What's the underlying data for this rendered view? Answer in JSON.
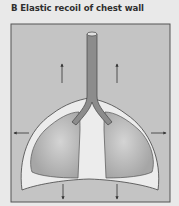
{
  "title": "B Elastic recoil of chest wall",
  "diagram": {
    "elements": [
      "trachea",
      "bronchi",
      "left-lung",
      "right-lung",
      "pleural-space",
      "chest-wall",
      "diaphragm"
    ],
    "arrows": [
      {
        "position": "upper-left",
        "direction": "up"
      },
      {
        "position": "upper-right",
        "direction": "up"
      },
      {
        "position": "left",
        "direction": "left"
      },
      {
        "position": "right",
        "direction": "right"
      },
      {
        "position": "lower-left",
        "direction": "down"
      },
      {
        "position": "lower-right",
        "direction": "down"
      }
    ],
    "colors": {
      "background": "#e9e9e9",
      "frame_fill": "#c4c4c4",
      "frame_border": "#555555",
      "chest_wall": "#ececec",
      "lung": "#b0b0b0",
      "airway": "#8c8c8c",
      "outline": "#444444"
    }
  }
}
